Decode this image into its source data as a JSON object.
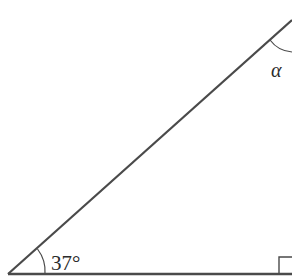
{
  "diagram": {
    "type": "right-triangle",
    "stroke_color": "#4a4a4a",
    "background": "#ffffff",
    "angles": {
      "bottom_left": {
        "label": "37°"
      },
      "top": {
        "label": "α"
      },
      "bottom_right": {
        "marker": "right-angle"
      }
    }
  }
}
